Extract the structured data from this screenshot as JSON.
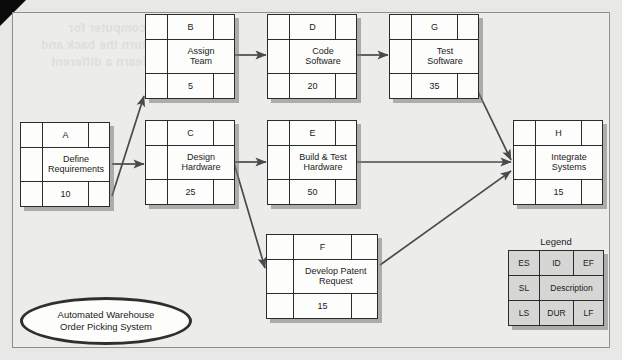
{
  "figure": {
    "type": "activity-on-node-network-diagram",
    "ghost_text": "computer for\nturn the back and\nlearn a different"
  },
  "project": {
    "title_line_1": "Automated Warehouse",
    "title_line_2": "Order Picking System"
  },
  "legend": {
    "title": "Legend",
    "cells": {
      "es": "ES",
      "id": "ID",
      "ef": "EF",
      "sl": "SL",
      "description": "Description",
      "ls": "LS",
      "dur": "DUR",
      "lf": "LF"
    }
  },
  "nodes": [
    {
      "key": "A",
      "id": "A",
      "description": "Define Requirements",
      "desc_line_1": "Define",
      "desc_line_2": "Requirements",
      "duration": "10",
      "es": "",
      "ef": "",
      "sl": "",
      "ls": "",
      "lf": ""
    },
    {
      "key": "B",
      "id": "B",
      "description": "Assign Team",
      "desc_line_1": "Assign",
      "desc_line_2": "Team",
      "duration": "5",
      "es": "",
      "ef": "",
      "sl": "",
      "ls": "",
      "lf": ""
    },
    {
      "key": "C",
      "id": "C",
      "description": "Design Hardware",
      "desc_line_1": "Design",
      "desc_line_2": "Hardware",
      "duration": "25",
      "es": "",
      "ef": "",
      "sl": "",
      "ls": "",
      "lf": ""
    },
    {
      "key": "D",
      "id": "D",
      "description": "Code Software",
      "desc_line_1": "Code",
      "desc_line_2": "Software",
      "duration": "20",
      "es": "",
      "ef": "",
      "sl": "",
      "ls": "",
      "lf": ""
    },
    {
      "key": "E",
      "id": "E",
      "description": "Build & Test Hardware",
      "desc_line_1": "Build & Test",
      "desc_line_2": "Hardware",
      "duration": "50",
      "es": "",
      "ef": "",
      "sl": "",
      "ls": "",
      "lf": ""
    },
    {
      "key": "F",
      "id": "F",
      "description": "Develop Patent Request",
      "desc_line_1": "Develop Patent",
      "desc_line_2": "Request",
      "duration": "15",
      "es": "",
      "ef": "",
      "sl": "",
      "ls": "",
      "lf": ""
    },
    {
      "key": "G",
      "id": "G",
      "description": "Test Software",
      "desc_line_1": "Test",
      "desc_line_2": "Software",
      "duration": "35",
      "es": "",
      "ef": "",
      "sl": "",
      "ls": "",
      "lf": ""
    },
    {
      "key": "H",
      "id": "H",
      "description": "Integrate Systems",
      "desc_line_1": "Integrate",
      "desc_line_2": "Systems",
      "duration": "15",
      "es": "",
      "ef": "",
      "sl": "",
      "ls": "",
      "lf": ""
    }
  ],
  "edges": [
    {
      "from": "A",
      "to": "B"
    },
    {
      "from": "A",
      "to": "C"
    },
    {
      "from": "B",
      "to": "D"
    },
    {
      "from": "C",
      "to": "E"
    },
    {
      "from": "C",
      "to": "F"
    },
    {
      "from": "D",
      "to": "G"
    },
    {
      "from": "E",
      "to": "H"
    },
    {
      "from": "F",
      "to": "H"
    },
    {
      "from": "G",
      "to": "H"
    }
  ],
  "colors": {
    "paper": "#ececeb",
    "node_fill": "#fdfdfc",
    "ink": "#2b2b2b",
    "legend_fill": "#d6d6d4",
    "shadow": "#787876"
  }
}
